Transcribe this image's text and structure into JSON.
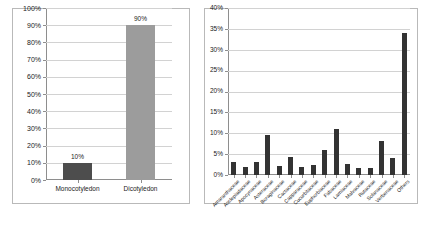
{
  "figure": {
    "background_color": "#ffffff",
    "panel_count": 2
  },
  "chart_data": [
    {
      "id": "left",
      "type": "bar",
      "title": "",
      "xlabel": "",
      "ylabel": "",
      "categories": [
        "Monocotyledon",
        "Dicotyledon"
      ],
      "values": [
        10,
        90
      ],
      "value_labels": [
        "10%",
        "90%"
      ],
      "bar_colors": [
        "#4d4d4d",
        "#9c9c9c"
      ],
      "ylim": [
        0,
        100
      ],
      "ytick_values": [
        0,
        10,
        20,
        30,
        40,
        50,
        60,
        70,
        80,
        90,
        100
      ],
      "ytick_labels": [
        "0%",
        "10%",
        "20%",
        "30%",
        "40%",
        "50%",
        "60%",
        "70%",
        "80%",
        "90%",
        "100%"
      ],
      "grid": true,
      "legend": false,
      "data_labels_shown": true
    },
    {
      "id": "right",
      "type": "bar",
      "title": "",
      "xlabel": "",
      "ylabel": "",
      "categories": [
        "Amaranthaceae",
        "Asclepiadaceae",
        "Apocynaceae",
        "Asteraceae",
        "Boraginaceae",
        "Cactaceae",
        "Capparaceae",
        "Cucurbitaceae",
        "Euphorbiaceae",
        "Fabaceae",
        "Lamiaceae",
        "Malvaceae",
        "Rutaceae",
        "Solanaceae",
        "Verbenaceae",
        "Others"
      ],
      "values": [
        3.2,
        2.0,
        3.0,
        9.5,
        2.1,
        4.2,
        2.0,
        2.5,
        6.0,
        11.0,
        2.6,
        1.8,
        1.8,
        8.2,
        4.0,
        34.0
      ],
      "bar_color": "#333333",
      "ylim": [
        0,
        40
      ],
      "ytick_values": [
        0,
        5,
        10,
        15,
        20,
        25,
        30,
        35,
        40
      ],
      "ytick_labels": [
        "0%",
        "5%",
        "10%",
        "15%",
        "20%",
        "25%",
        "30%",
        "35%",
        "40%"
      ],
      "grid": true,
      "legend": false,
      "data_labels_shown": false,
      "xtick_label_rotation": -45
    }
  ]
}
